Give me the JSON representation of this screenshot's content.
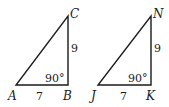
{
  "triangles": [
    {
      "name": "ABC",
      "vertices": {
        "A": "A",
        "B": "B",
        "C": "C"
      },
      "sides": {
        "AB": "7",
        "BC": "9"
      },
      "angle_B": "90°"
    },
    {
      "name": "JKN",
      "vertices": {
        "J": "J",
        "K": "K",
        "N": "N"
      },
      "sides": {
        "JK": "7",
        "KN": "9"
      },
      "angle_K": "90°"
    }
  ],
  "colors": {
    "stroke": "#1a1a1a",
    "background": "#ffffff"
  }
}
